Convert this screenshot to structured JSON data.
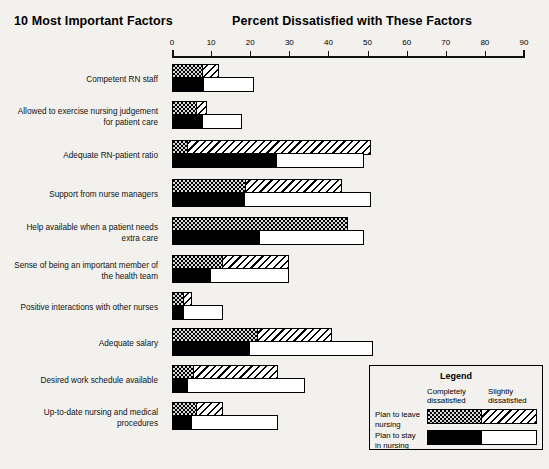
{
  "header": {
    "left_title": "10 Most Important Factors",
    "right_title": "Percent Dissatisfied with These Factors"
  },
  "legend": {
    "title": "Legend",
    "col_completely": "Completely\ndissatisfied",
    "col_slightly": "Slightly\ndissatisfied",
    "row_leave": "Plan to leave\nnursing",
    "row_stay": "Plan to stay\nin nursing"
  },
  "colors": {
    "ink": "#000000",
    "page": "#f2f1ee",
    "dotted_ground": "#d9d9d9",
    "white": "#ffffff"
  },
  "chart_data": {
    "type": "bar",
    "orientation": "horizontal",
    "title": "Percent Dissatisfied with These Factors",
    "subtitle": "10 Most Important Factors",
    "xlabel": "Percent Dissatisfied with These Factors",
    "ylabel": "10 Most Important Factors",
    "xlim": [
      0,
      90
    ],
    "xticks": [
      0,
      10,
      20,
      30,
      40,
      50,
      60,
      70,
      80,
      90
    ],
    "grid": false,
    "legend_position": "bottom-right",
    "stacked": true,
    "group_names": [
      "Plan to leave nursing",
      "Plan to stay in nursing"
    ],
    "segment_names": [
      "Completely dissatisfied",
      "Slightly dissatisfied"
    ],
    "categories": [
      "Competent RN staff",
      "Allowed to exercise nursing judgement\nfor patient care",
      "Adequate RN-patient ratio",
      "Support from nurse managers",
      "Help available when a patient needs\nextra care",
      "Sense of being an important member of\nthe health team",
      "Positive interactions with other nurses",
      "Adequate salary",
      "Desired work schedule available",
      "Up-to-date nursing and medical\nprocedures"
    ],
    "series": [
      {
        "name": "Plan to leave nursing - Completely dissatisfied",
        "group": "Plan to leave nursing",
        "segment": "Completely dissatisfied",
        "values": [
          8,
          6.5,
          4,
          19,
          45,
          13,
          3,
          22,
          5.5,
          6.5
        ]
      },
      {
        "name": "Plan to leave nursing - Slightly dissatisfied",
        "group": "Plan to leave nursing",
        "segment": "Slightly dissatisfied",
        "values": [
          4,
          2.5,
          47,
          24.5,
          0,
          17,
          2,
          19,
          21.5,
          6.5
        ]
      },
      {
        "name": "Plan to stay in nursing - Completely dissatisfied",
        "group": "Plan to stay in nursing",
        "segment": "Completely dissatisfied",
        "values": [
          8,
          8,
          27,
          18.5,
          22.5,
          10,
          3,
          20,
          4,
          5
        ]
      },
      {
        "name": "Plan to stay in nursing - Slightly dissatisfied",
        "group": "Plan to stay in nursing",
        "segment": "Slightly dissatisfied",
        "values": [
          13,
          10,
          22,
          32.5,
          26.5,
          20,
          10,
          31.5,
          30,
          22
        ]
      }
    ],
    "totals": {
      "plan_to_leave": [
        12,
        9,
        51,
        43.5,
        45,
        30,
        5,
        41,
        27,
        13
      ],
      "plan_to_stay": [
        21,
        18,
        49,
        51,
        49,
        30,
        13,
        51.5,
        34,
        27
      ]
    }
  }
}
